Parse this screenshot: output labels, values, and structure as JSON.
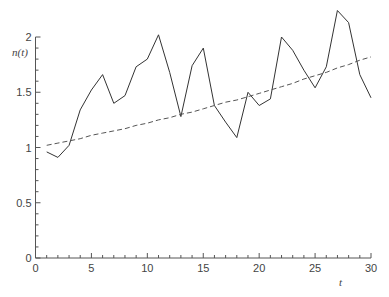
{
  "chart_data": {
    "type": "line",
    "title": "",
    "xlabel": "t",
    "ylabel": "n(t)",
    "xlim": [
      0,
      30
    ],
    "ylim": [
      0,
      2
    ],
    "grid": false,
    "legend": null,
    "x_ticks": [
      0,
      5,
      10,
      15,
      20,
      25,
      30
    ],
    "x_tick_labels": [
      "0",
      "5",
      "10",
      "15",
      "20",
      "25",
      "30"
    ],
    "y_ticks": [
      0,
      0.5,
      1,
      1.5,
      2
    ],
    "y_tick_labels": [
      "0",
      "0.5",
      "1",
      "1.5",
      "2"
    ],
    "x_minor_step": 1,
    "y_minor_step": 0.1,
    "x": [
      1,
      2,
      3,
      4,
      5,
      6,
      7,
      8,
      9,
      10,
      11,
      12,
      13,
      14,
      15,
      16,
      17,
      18,
      19,
      20,
      21,
      22,
      23,
      24,
      25,
      26,
      27,
      28,
      29,
      30
    ],
    "series": [
      {
        "name": "n(t) observed",
        "style": "solid",
        "color": "#333333",
        "values": [
          0.96,
          0.91,
          1.02,
          1.34,
          1.52,
          1.66,
          1.4,
          1.47,
          1.73,
          1.8,
          2.02,
          1.68,
          1.28,
          1.74,
          1.9,
          1.38,
          1.23,
          1.09,
          1.5,
          1.38,
          1.44,
          2.0,
          1.88,
          1.7,
          1.54,
          1.73,
          2.24,
          2.13,
          1.66,
          1.45
        ]
      },
      {
        "name": "n(t) trend",
        "style": "dashed",
        "color": "#555555",
        "values": [
          1.02,
          1.04,
          1.06,
          1.08,
          1.11,
          1.13,
          1.15,
          1.17,
          1.2,
          1.22,
          1.25,
          1.27,
          1.3,
          1.32,
          1.35,
          1.38,
          1.41,
          1.43,
          1.46,
          1.49,
          1.52,
          1.55,
          1.58,
          1.62,
          1.65,
          1.68,
          1.72,
          1.75,
          1.79,
          1.82
        ]
      }
    ]
  }
}
